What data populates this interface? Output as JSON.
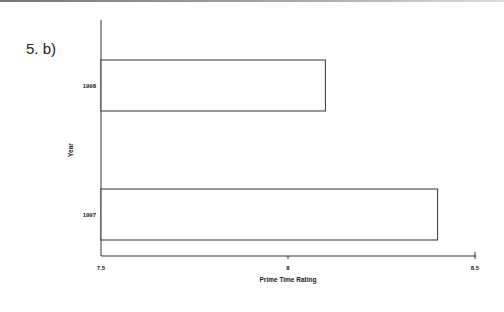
{
  "question_label": "5.  b)",
  "chart_data": {
    "type": "bar",
    "orientation": "horizontal",
    "title": "",
    "xlabel": "Prime Time Rating",
    "ylabel": "Year",
    "categories": [
      "1997",
      "1998"
    ],
    "values": [
      8.4,
      8.1
    ],
    "xlim": [
      7.5,
      8.5
    ],
    "xticks": [
      "7.5",
      "8",
      "8.5"
    ],
    "grid": false,
    "legend": null
  }
}
